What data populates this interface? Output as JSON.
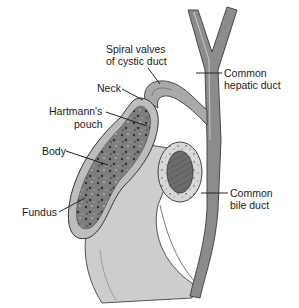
{
  "diagram": {
    "labels": {
      "spiral_valves_line1": "Spiral valves",
      "spiral_valves_line2": "of cystic duct",
      "neck": "Neck",
      "hartmann_line1": "Hartmann's",
      "hartmann_line2": "pouch",
      "body": "Body",
      "fundus": "Fundus",
      "common_hepatic_line1": "Common",
      "common_hepatic_line2": "hepatic duct",
      "common_bile_line1": "Common",
      "common_bile_line2": "bile duct"
    },
    "colors": {
      "duct_fill": "#8f8f8f",
      "duct_light": "#c4c4c4",
      "gallbladder_mucosa": "#7a7a7a",
      "wall": "#bdbdbd",
      "duodenum": "#cfcfcf",
      "outline": "#333333"
    }
  }
}
